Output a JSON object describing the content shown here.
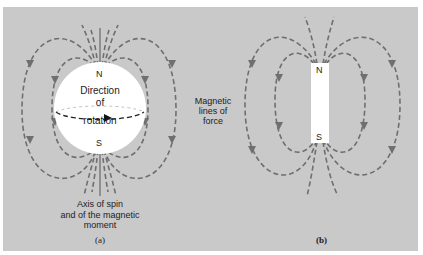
{
  "figure": {
    "background_color": "#c9c9c9",
    "field_line_color": "#6f6f6f",
    "panel_a": {
      "object": "spinning sphere",
      "north_label": "N",
      "south_label": "S",
      "rotation_label_line1": "Direction",
      "rotation_label_line2": "of",
      "rotation_label_line3": "rotation",
      "axis_label_line1": "Axis of spin",
      "axis_label_line2": "and of the magnetic",
      "axis_label_line3": "moment",
      "caption": "(a)"
    },
    "center_label": {
      "line1": "Magnetic",
      "line2": "lines of",
      "line3": "force"
    },
    "panel_b": {
      "object": "bar magnet",
      "north_label": "N",
      "south_label": "S",
      "caption": "(b)"
    }
  }
}
